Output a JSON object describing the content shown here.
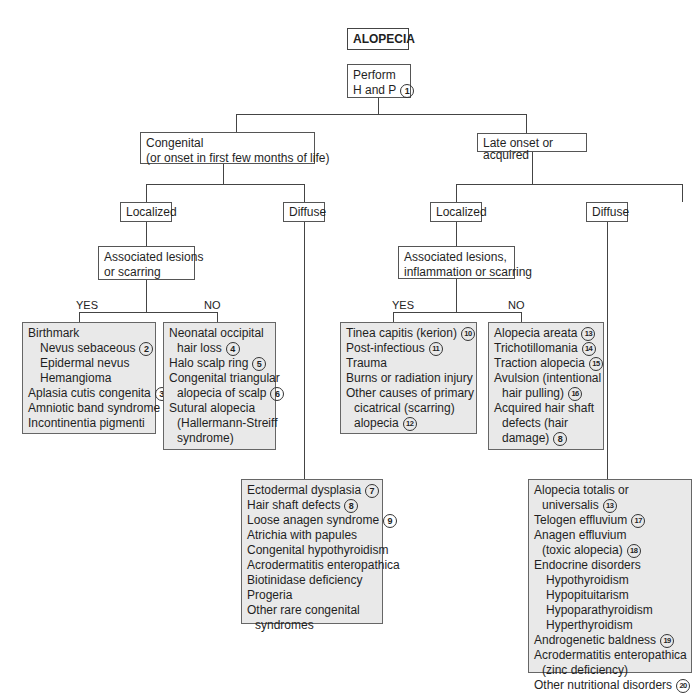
{
  "title": "ALOPECIA",
  "root": {
    "lines": [
      "Perform",
      "H and P"
    ],
    "ref": "1"
  },
  "congenital": {
    "label_lines": [
      "Congenital",
      "(or onset in first few months of life)"
    ],
    "localized": {
      "label": "Localized",
      "question_lines": [
        "Associated lesions",
        "or scarring"
      ],
      "yes_label": "YES",
      "no_label": "NO",
      "yes_items": [
        {
          "text": "Birthmark",
          "indent": 0,
          "ref": ""
        },
        {
          "text": "Nevus sebaceous",
          "indent": 1,
          "ref": "2"
        },
        {
          "text": "Epidermal nevus",
          "indent": 1,
          "ref": ""
        },
        {
          "text": "Hemangioma",
          "indent": 1,
          "ref": ""
        },
        {
          "text": "Aplasia cutis congenita",
          "indent": 0,
          "ref": "3"
        },
        {
          "text": "Amniotic band syndrome",
          "indent": 0,
          "ref": ""
        },
        {
          "text": "Incontinentia pigmenti",
          "indent": 0,
          "ref": ""
        }
      ],
      "no_items": [
        {
          "text": "Neonatal occipital",
          "indent": 0,
          "ref": ""
        },
        {
          "text": "hair loss",
          "indent": 2,
          "ref": "4"
        },
        {
          "text": "Halo scalp ring",
          "indent": 0,
          "ref": "5"
        },
        {
          "text": "Congenital triangular",
          "indent": 0,
          "ref": ""
        },
        {
          "text": "alopecia of scalp",
          "indent": 2,
          "ref": "6"
        },
        {
          "text": "Sutural alopecia",
          "indent": 0,
          "ref": ""
        },
        {
          "text": "(Hallermann-Streiff",
          "indent": 2,
          "ref": ""
        },
        {
          "text": "syndrome)",
          "indent": 2,
          "ref": ""
        }
      ]
    },
    "diffuse": {
      "label": "Diffuse",
      "items": [
        {
          "text": "Ectodermal dysplasia",
          "indent": 0,
          "ref": "7"
        },
        {
          "text": "Hair shaft defects",
          "indent": 0,
          "ref": "8"
        },
        {
          "text": "Loose anagen syndrome",
          "indent": 0,
          "ref": "9"
        },
        {
          "text": "Atrichia with papules",
          "indent": 0,
          "ref": ""
        },
        {
          "text": "Congenital hypothyroidism",
          "indent": 0,
          "ref": ""
        },
        {
          "text": "Acrodermatitis enteropathica",
          "indent": 0,
          "ref": ""
        },
        {
          "text": "Biotinidase deficiency",
          "indent": 0,
          "ref": ""
        },
        {
          "text": "Progeria",
          "indent": 0,
          "ref": ""
        },
        {
          "text": "Other rare congenital",
          "indent": 0,
          "ref": ""
        },
        {
          "text": "syndromes",
          "indent": 2,
          "ref": ""
        }
      ]
    }
  },
  "acquired": {
    "label": "Late onset or acquired",
    "localized": {
      "label": "Localized",
      "question_lines": [
        "Associated lesions,",
        "inflammation or scarring"
      ],
      "yes_label": "YES",
      "no_label": "NO",
      "yes_items": [
        {
          "text": "Tinea capitis (kerion)",
          "indent": 0,
          "ref": "10"
        },
        {
          "text": "Post-infectious",
          "indent": 0,
          "ref": "11"
        },
        {
          "text": "Trauma",
          "indent": 0,
          "ref": ""
        },
        {
          "text": "Burns or radiation injury",
          "indent": 0,
          "ref": ""
        },
        {
          "text": "Other causes of primary",
          "indent": 0,
          "ref": ""
        },
        {
          "text": "cicatrical (scarring)",
          "indent": 2,
          "ref": ""
        },
        {
          "text": "alopecia",
          "indent": 2,
          "ref": "12"
        }
      ],
      "no_items": [
        {
          "text": "Alopecia areata",
          "indent": 0,
          "ref": "13"
        },
        {
          "text": "Trichotillomania",
          "indent": 0,
          "ref": "14"
        },
        {
          "text": "Traction alopecia",
          "indent": 0,
          "ref": "15"
        },
        {
          "text": "Avulsion (intentional",
          "indent": 0,
          "ref": ""
        },
        {
          "text": "hair pulling)",
          "indent": 2,
          "ref": "16"
        },
        {
          "text": "Acquired hair shaft",
          "indent": 0,
          "ref": ""
        },
        {
          "text": "defects (hair",
          "indent": 2,
          "ref": ""
        },
        {
          "text": "damage)",
          "indent": 2,
          "ref": "8"
        }
      ]
    },
    "diffuse": {
      "label": "Diffuse",
      "items": [
        {
          "text": "Alopecia totalis or",
          "indent": 0,
          "ref": ""
        },
        {
          "text": "universalis",
          "indent": 2,
          "ref": "13"
        },
        {
          "text": "Telogen effluvium",
          "indent": 0,
          "ref": "17"
        },
        {
          "text": "Anagen effluvium",
          "indent": 0,
          "ref": ""
        },
        {
          "text": "(toxic alopecia)",
          "indent": 2,
          "ref": "18"
        },
        {
          "text": "Endocrine disorders",
          "indent": 0,
          "ref": ""
        },
        {
          "text": "Hypothyroidism",
          "indent": 1,
          "ref": ""
        },
        {
          "text": "Hypopituitarism",
          "indent": 1,
          "ref": ""
        },
        {
          "text": "Hypoparathyroidism",
          "indent": 1,
          "ref": ""
        },
        {
          "text": "Hyperthyroidism",
          "indent": 1,
          "ref": ""
        },
        {
          "text": "Androgenetic baldness",
          "indent": 0,
          "ref": "19"
        },
        {
          "text": "Acrodermatitis enteropathica",
          "indent": 0,
          "ref": ""
        },
        {
          "text": "(zinc deficiency)",
          "indent": 2,
          "ref": ""
        },
        {
          "text": "Other nutritional disorders",
          "indent": 0,
          "ref": "20"
        }
      ]
    }
  }
}
